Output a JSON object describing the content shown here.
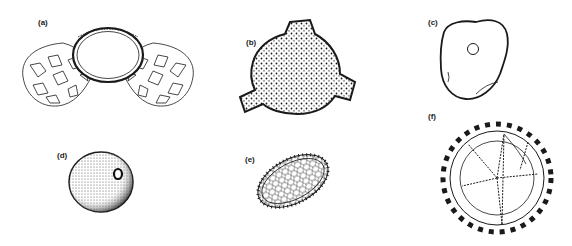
{
  "figure": {
    "panels": [
      {
        "id": "a",
        "label": "(a)",
        "description": "bisaccate pollen grain with reticulate air sacs"
      },
      {
        "id": "b",
        "label": "(b)",
        "description": "triporate pollen grain with granular surface"
      },
      {
        "id": "c",
        "label": "(c)",
        "description": "smooth irregular pollen grain with single pore"
      },
      {
        "id": "d",
        "label": "(d)",
        "description": "spherical stippled pollen grain with one pore"
      },
      {
        "id": "e",
        "label": "(e)",
        "description": "ellipsoidal reticulate pollen grain"
      },
      {
        "id": "f",
        "label": "(f)",
        "description": "echinate tetrad-like pollen grain with spines"
      }
    ]
  },
  "colors": {
    "ink": "#1a1a1a",
    "background": "#ffffff"
  }
}
